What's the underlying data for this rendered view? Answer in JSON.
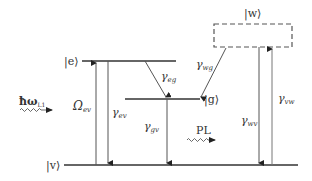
{
  "diagram": {
    "type": "energy-level-diagram",
    "states": {
      "e": "|e⟩",
      "g": "|g⟩",
      "v": "|v⟩",
      "w": "|w⟩"
    },
    "transitions": {
      "omega_ev": {
        "symbol": "Ω",
        "sub": "ev",
        "direction": "up",
        "from": "v",
        "to": "e"
      },
      "gamma_ev": {
        "symbol": "γ",
        "sub": "ev",
        "direction": "down",
        "from": "e",
        "to": "v"
      },
      "gamma_eg": {
        "symbol": "γ",
        "sub": "eg",
        "direction": "down",
        "from": "e",
        "to": "g"
      },
      "gamma_wg": {
        "symbol": "γ",
        "sub": "wg",
        "direction": "down",
        "from": "w",
        "to": "g"
      },
      "gamma_gv": {
        "symbol": "γ",
        "sub": "gv",
        "direction": "down",
        "from": "g",
        "to": "v"
      },
      "gamma_wv": {
        "symbol": "γ",
        "sub": "wv",
        "direction": "down",
        "from": "w",
        "to": "v"
      },
      "gamma_vw": {
        "symbol": "γ",
        "sub": "vw",
        "direction": "up",
        "from": "v",
        "to": "w"
      }
    },
    "excitation": {
      "symbol": "ħω",
      "sub": "L1"
    },
    "emission": {
      "label": "PL"
    },
    "colors": {
      "line": "#333333",
      "text": "#333333",
      "dashed_box": "#555555"
    }
  }
}
